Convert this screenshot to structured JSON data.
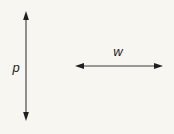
{
  "figure": {
    "type": "dimension-diagram",
    "background_color": "#f8f6f1",
    "stroke_color": "#3a3a3a",
    "label_color": "#1c1c1c",
    "labels": {
      "vertical": "p",
      "horizontal": "w"
    },
    "arrows": [
      {
        "name": "vertical-dimension-arrow",
        "orientation": "vertical",
        "double_headed": true,
        "x": 26,
        "y_start": 13,
        "y_end": 119,
        "label": "p",
        "label_x": 16,
        "label_y": 68
      },
      {
        "name": "horizontal-dimension-arrow",
        "orientation": "horizontal",
        "double_headed": true,
        "y": 66,
        "x_start": 76,
        "x_end": 162,
        "label": "w",
        "label_x": 118,
        "label_y": 53
      }
    ]
  }
}
